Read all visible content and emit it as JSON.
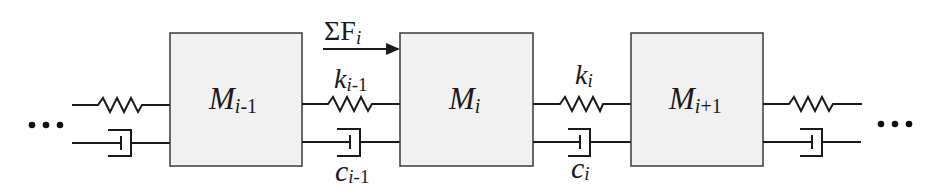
{
  "diagram": {
    "type": "mass-spring-damper chain",
    "ellipsis_left": "...",
    "ellipsis_right": "...",
    "force": {
      "symbol": "ΣF",
      "subscript": "i"
    },
    "masses": [
      {
        "symbol": "M",
        "sub_var": "i",
        "sub_rest": "-1"
      },
      {
        "symbol": "M",
        "sub_var": "i",
        "sub_rest": ""
      },
      {
        "symbol": "M",
        "sub_var": "i",
        "sub_rest": "+1"
      }
    ],
    "springs": [
      {
        "symbol": "k",
        "sub_var": "i",
        "sub_rest": "-1"
      },
      {
        "symbol": "k",
        "sub_var": "i",
        "sub_rest": ""
      }
    ],
    "dampers": [
      {
        "symbol": "c",
        "sub_var": "i",
        "sub_rest": "-1"
      },
      {
        "symbol": "c",
        "sub_var": "i",
        "sub_rest": ""
      }
    ],
    "colors": {
      "line": "#1a1a1a",
      "mass_fill": "#f1f1f1",
      "mass_stroke": "#3a3a3a"
    }
  }
}
